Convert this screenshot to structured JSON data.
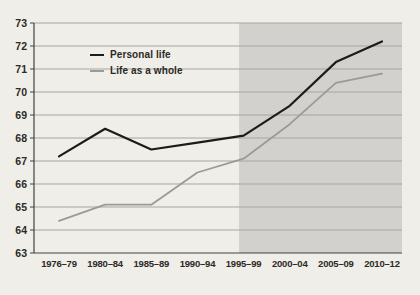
{
  "chart_data": {
    "type": "line",
    "categories": [
      "1976–79",
      "1980–84",
      "1985–89",
      "1990–94",
      "1995–99",
      "2000–04",
      "2005–09",
      "2010–12"
    ],
    "series": [
      {
        "name": "Personal life",
        "color": "#1d1c1a",
        "width": 2.2,
        "values": [
          67.2,
          68.4,
          67.5,
          67.8,
          68.1,
          69.4,
          71.3,
          72.2
        ]
      },
      {
        "name": "Life as a whole",
        "color": "#9b9a95",
        "width": 1.8,
        "values": [
          64.4,
          65.1,
          65.1,
          66.5,
          67.1,
          68.6,
          70.4,
          70.8
        ]
      }
    ],
    "title": "",
    "xlabel": "",
    "ylabel": "",
    "ylim": [
      63,
      73
    ],
    "ytick_step": 1,
    "yticks": [
      63,
      64,
      65,
      66,
      67,
      68,
      69,
      70,
      71,
      72,
      73
    ],
    "grid": true,
    "legend_position": "inside-top-left",
    "shaded_region": {
      "from_category": "1995–99",
      "to": "end",
      "note": "shading covers 1995–99 through 2010–12"
    }
  },
  "colors": {
    "background": "#f0eee8",
    "shaded_region": "#d3d1cd",
    "gridline": "#a7a5a0",
    "axis": "#44423e",
    "tick_text": "#2b2a27"
  }
}
